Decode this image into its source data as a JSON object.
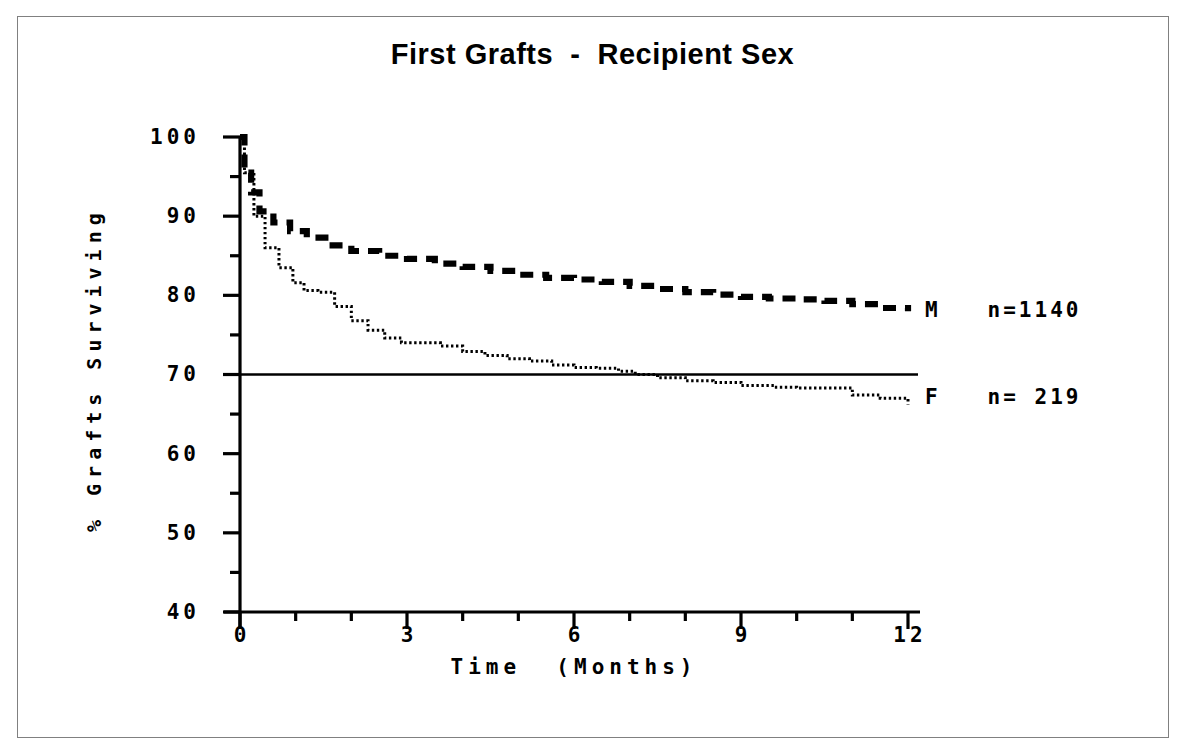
{
  "chart_data": {
    "type": "line",
    "title": "First Grafts  -  Recipient Sex",
    "xlabel": "Time  (Months)",
    "ylabel": "% Grafts Surviving",
    "xlim": [
      0,
      12
    ],
    "ylim": [
      40,
      100
    ],
    "xticks": [
      "0",
      "3",
      "6",
      "9",
      "12"
    ],
    "xtick_values": [
      0,
      3,
      6,
      9,
      12
    ],
    "xminor_interval": 1,
    "yticks": [
      "100",
      "90",
      "80",
      "70",
      "60",
      "50",
      "40"
    ],
    "ytick_values": [
      100,
      90,
      80,
      70,
      60,
      50,
      40
    ],
    "yminor_interval": 5,
    "grid": false,
    "legend_position": "right-inline",
    "reference_line": {
      "y": 70,
      "style": "solid",
      "label": ""
    },
    "series": [
      {
        "name": "M",
        "label": "M",
        "n_label": "n=1140",
        "n": 1140,
        "style": "dashed",
        "color": "#000000",
        "x": [
          0,
          0.08,
          0.2,
          0.35,
          0.6,
          0.9,
          1.2,
          1.6,
          2.0,
          2.5,
          3.0,
          3.5,
          4.0,
          4.5,
          5.0,
          5.5,
          6.0,
          6.5,
          7.0,
          7.5,
          8.0,
          8.5,
          9.0,
          9.5,
          10.0,
          10.5,
          11.0,
          11.5,
          12.0
        ],
        "y": [
          100,
          95.5,
          93.0,
          90.6,
          89.2,
          88.1,
          87.3,
          86.3,
          85.6,
          85.0,
          84.6,
          84.0,
          83.6,
          83.1,
          82.6,
          82.2,
          82.0,
          81.7,
          81.2,
          80.8,
          80.4,
          80.1,
          79.8,
          79.6,
          79.5,
          79.3,
          78.9,
          78.4,
          78.0
        ]
      },
      {
        "name": "F",
        "label": "F",
        "n_label": "n= 219",
        "n": 219,
        "style": "dotted",
        "color": "#000000",
        "x": [
          0,
          0.08,
          0.25,
          0.45,
          0.7,
          0.95,
          1.15,
          1.4,
          1.7,
          2.0,
          2.3,
          2.6,
          2.9,
          3.2,
          3.6,
          4.0,
          4.4,
          4.8,
          5.2,
          5.6,
          6.0,
          6.4,
          6.8,
          7.1,
          7.5,
          8.0,
          8.5,
          9.0,
          9.6,
          10.0,
          10.4,
          11.0,
          11.5,
          12.0
        ],
        "y": [
          100,
          95.5,
          90.0,
          86.0,
          83.5,
          81.6,
          80.6,
          80.4,
          78.6,
          76.8,
          75.6,
          74.6,
          74.0,
          74.0,
          73.6,
          72.9,
          72.4,
          72.0,
          71.7,
          71.2,
          70.9,
          70.8,
          70.4,
          70.0,
          69.6,
          69.2,
          69.0,
          68.6,
          68.4,
          68.3,
          68.3,
          67.4,
          67.0,
          66.2
        ]
      }
    ],
    "annotations": [
      {
        "name": "legend-m",
        "text": "M   n=1140",
        "x": 12.25,
        "y": 78.0
      },
      {
        "name": "legend-f",
        "text": "F   n= 219",
        "x": 12.25,
        "y": 68.0
      }
    ]
  },
  "legend": {
    "m": {
      "sex": "M",
      "count": "n=1140"
    },
    "f": {
      "sex": "F",
      "count": "n= 219"
    }
  },
  "axes": {
    "y_label": "% Grafts Surviving",
    "x_label": "Time  (Months)",
    "y_ticks": [
      "100",
      "90",
      "80",
      "70",
      "60",
      "50",
      "40"
    ],
    "x_ticks": [
      "0",
      "3",
      "6",
      "9",
      "12"
    ]
  },
  "colors": {
    "ink": "#000000",
    "frame": "#808080",
    "background": "#ffffff"
  }
}
